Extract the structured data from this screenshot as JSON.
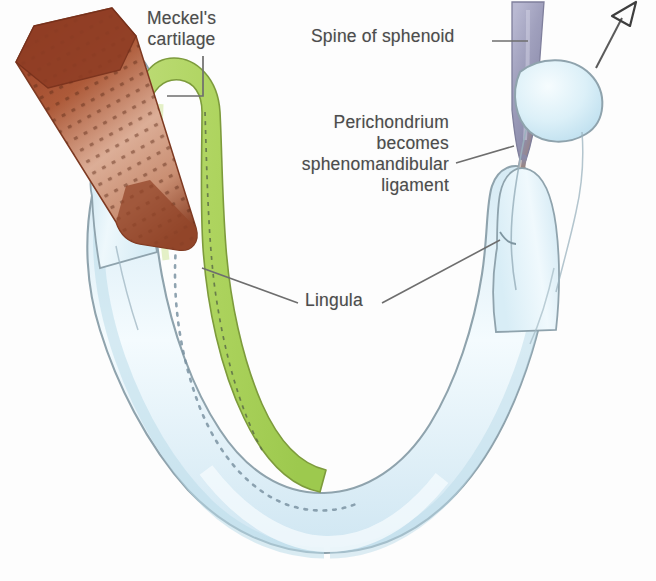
{
  "figure": {
    "background_color": "#fdfdfd"
  },
  "labels": {
    "meckel": "Meckel's\ncartilage",
    "spine": "Spine of sphenoid",
    "perichondrium": "Perichondrium\nbecomes\nsphenomandibular\nligament",
    "lingula": "Lingula"
  },
  "colors": {
    "bone_fill": "#dceef6",
    "bone_fill_light": "#f2fafd",
    "bone_outline": "#8fa3ad",
    "cartilage_green": "#aed45f",
    "cartilage_green_light": "#c3de83",
    "cartilage_outline": "#7d9b3c",
    "muscle_brown": "#a0512f",
    "muscle_brown_dark": "#8c3f27",
    "muscle_brown_light": "#d8a48c",
    "spine_grey": "#9a9ab4",
    "spine_grey_light": "#c9c9dd",
    "ligament_brown": "#9a5334",
    "leader_line": "#6e6e6e",
    "label_text": "#4c4c4c",
    "dashed_canal": "#7b93a2"
  },
  "structures": [
    {
      "name": "mandible",
      "description": "U-shaped developing mandible seen from above, pale blue bone"
    },
    {
      "name": "meckels-cartilage",
      "description": "Green rod running along the inner aspect of the left mandibular body and ramus"
    },
    {
      "name": "lateral-pterygoid-muscle",
      "description": "Brown stippled band attaching to the left condylar neck"
    },
    {
      "name": "spine-of-sphenoid",
      "description": "Grey-violet tapering spine at upper right"
    },
    {
      "name": "sphenomandibular-ligament",
      "description": "Thin brown strand descending from the spine of sphenoid to the lingula"
    },
    {
      "name": "mandibular-canal",
      "description": "Dotted line tracing the inferior alveolar canal within the bone"
    },
    {
      "name": "orientation-arrow",
      "description": "Thin arrow at top right pointing up and to the right"
    }
  ],
  "leaders": [
    {
      "name": "meckel-leader",
      "type": "elbow"
    },
    {
      "name": "spine-leader",
      "type": "horizontal"
    },
    {
      "name": "perichondrium-leader",
      "type": "diagonal"
    },
    {
      "name": "lingula-leader-left",
      "type": "diagonal"
    },
    {
      "name": "lingula-leader-right",
      "type": "diagonal"
    }
  ]
}
